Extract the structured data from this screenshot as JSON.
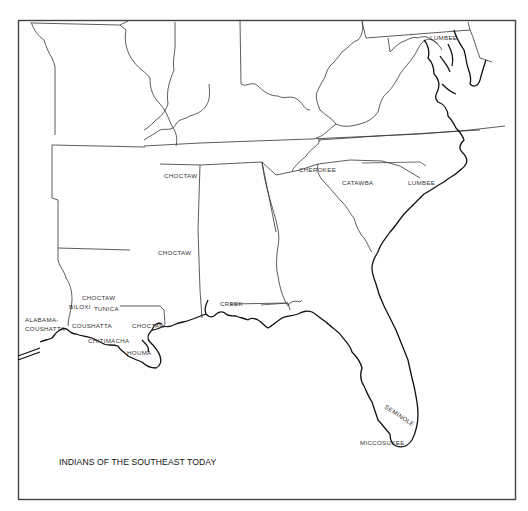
{
  "map": {
    "title": "INDIANS OF THE SOUTHEAST TODAY",
    "colors": {
      "background": "#ffffff",
      "lines": "#333333",
      "text": "#333333"
    },
    "labels": {
      "lumbee_north": "LUMBEE",
      "cherokee": "CHEROKEE",
      "catawba": "CATAWBA",
      "lumbee_nc": "LUMBEE",
      "choctaw_tn": "CHOCTAW",
      "choctaw_ms": "CHOCTAW",
      "choctaw_la_north": "CHOCTAW",
      "biloxi": "BILOXI",
      "tunica": "TUNICA",
      "alabama_coushatta_line1": "ALABAMA-",
      "alabama_coushatta_line2": "COUSHATTA",
      "coushatta": "COUSHATTA",
      "choctaw_la_south": "CHOCTAW",
      "chitimacha": "CHITIMACHA",
      "houma": "HOUMA",
      "creek": "CREEK",
      "seminole": "SEMINOLE",
      "miccosukee": "MICCOSUKEE"
    }
  }
}
